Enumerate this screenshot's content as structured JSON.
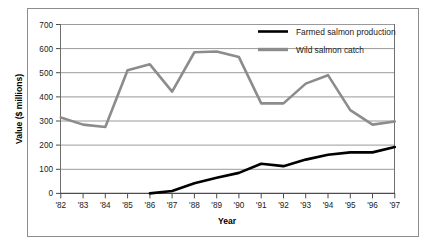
{
  "chart_data": {
    "type": "line",
    "title": "",
    "xlabel": "Year",
    "ylabel": "Value ($ millions)",
    "x": [
      "'82",
      "'83",
      "'84",
      "'85",
      "'86",
      "'87",
      "'88",
      "'89",
      "'90",
      "'91",
      "'92",
      "'93",
      "'94",
      "'95",
      "'96",
      "'97"
    ],
    "xlim": [
      0,
      15
    ],
    "ylim": [
      0,
      700
    ],
    "yticks": [
      0,
      100,
      200,
      300,
      400,
      500,
      600,
      700
    ],
    "ytick_labels": [
      "0",
      "100",
      "200",
      "300",
      "400",
      "500",
      "600",
      "700"
    ],
    "grid": "horizontal",
    "legend_position": "top-right",
    "series": [
      {
        "name": "Farmed salmon production",
        "color": "#000000",
        "linewidth": 2.6,
        "values": [
          null,
          null,
          null,
          null,
          0,
          10,
          42,
          65,
          85,
          123,
          113,
          140,
          160,
          170,
          170,
          192
        ]
      },
      {
        "name": "Wild salmon catch",
        "color": "#8c8c8c",
        "linewidth": 2.6,
        "values": [
          315,
          285,
          275,
          510,
          535,
          422,
          585,
          588,
          565,
          373,
          373,
          455,
          490,
          345,
          285,
          298
        ]
      }
    ]
  },
  "legend": {
    "items": [
      {
        "label": "Farmed salmon production",
        "color": "#000000"
      },
      {
        "label": "Wild salmon catch",
        "color": "#8c8c8c"
      }
    ]
  },
  "axes": {
    "y_title": "Value ($ millions)",
    "x_title": "Year"
  },
  "colors": {
    "farmed": "#000000",
    "wild": "#8c8c8c",
    "gridline": "#9a9a9a",
    "axis": "#4d4d4d",
    "frame": "#8d8d8d",
    "background": "#ffffff"
  }
}
